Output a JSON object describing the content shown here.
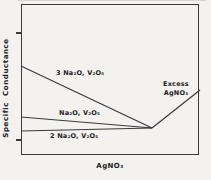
{
  "figure": {
    "ylabel": "Specific Conductance",
    "xlabel": "AgNO₃",
    "annotation": {
      "line1": "Excess",
      "line2": "AgNO₃"
    }
  },
  "colors": {
    "line": "#3a3a3a",
    "text": "#222222",
    "background": "#f3f2ef"
  },
  "chart_data": {
    "type": "line",
    "title": "",
    "xlabel": "AgNO₃",
    "ylabel": "Specific Conductance",
    "x_tick_labels": [],
    "y_tick_labels": [],
    "grid": false,
    "legend_position": "inline-labels",
    "line_color": "#3a3a3a",
    "series": [
      {
        "name": "3 Na₂O, V₂O₅",
        "points_px": [
          [
            21,
            66
          ],
          [
            152,
            128
          ]
        ]
      },
      {
        "name": "Na₂O, V₂O₅",
        "points_px": [
          [
            21,
            117
          ],
          [
            152,
            128
          ]
        ]
      },
      {
        "name": "2 Na₂O, V₂O₅",
        "points_px": [
          [
            21,
            131
          ],
          [
            152,
            128
          ]
        ]
      },
      {
        "name": "Excess AgNO₃",
        "points_px": [
          [
            152,
            128
          ],
          [
            200,
            90
          ]
        ]
      }
    ],
    "convergence_point_px": [
      152,
      128
    ]
  }
}
